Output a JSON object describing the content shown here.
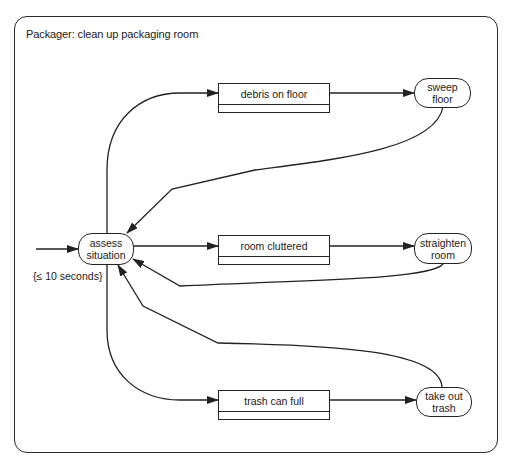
{
  "diagram": {
    "title": "Packager: clean up packaging room",
    "initial_state": {
      "label_line1": "assess",
      "label_line2": "situation",
      "constraint": "{≤ 10 seconds}"
    },
    "conditions": [
      {
        "label": "debris on floor"
      },
      {
        "label": "room cluttered"
      },
      {
        "label": "trash can full"
      }
    ],
    "actions": [
      {
        "label_line1": "sweep",
        "label_line2": "floor"
      },
      {
        "label_line1": "straighten",
        "label_line2": "room"
      },
      {
        "label_line1": "take out",
        "label_line2": "trash"
      }
    ],
    "colors": {
      "stroke": "#222222",
      "background": "#ffffff"
    }
  }
}
